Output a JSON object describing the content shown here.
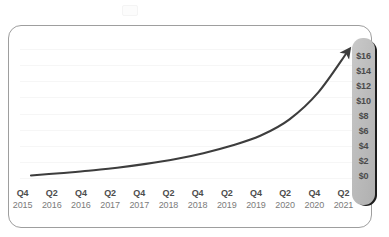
{
  "chart_data": {
    "type": "line",
    "title": "",
    "subtitle": "",
    "xlabel": "",
    "ylabel": "",
    "grid": true,
    "legend": "none",
    "arrow_head": true,
    "ylim": [
      0,
      16
    ],
    "y_ticks": [
      "$16",
      "$14",
      "$12",
      "$10",
      "$8",
      "$6",
      "$4",
      "$2",
      "$0"
    ],
    "y_tick_values": [
      16,
      14,
      12,
      10,
      8,
      6,
      4,
      2,
      0
    ],
    "categories": [
      "Q4 2015",
      "Q2 2016",
      "Q4 2016",
      "Q2 2017",
      "Q4 2017",
      "Q2 2018",
      "Q4 2018",
      "Q2 2019",
      "Q4 2019",
      "Q2 2020",
      "Q4 2020",
      "Q2 2021"
    ],
    "x_ticks": [
      {
        "quarter": "Q4",
        "year": "2015"
      },
      {
        "quarter": "Q2",
        "year": "2016"
      },
      {
        "quarter": "Q4",
        "year": "2016"
      },
      {
        "quarter": "Q2",
        "year": "2017"
      },
      {
        "quarter": "Q4",
        "year": "2017"
      },
      {
        "quarter": "Q2",
        "year": "2018"
      },
      {
        "quarter": "Q4",
        "year": "2018"
      },
      {
        "quarter": "Q2",
        "year": "2019"
      },
      {
        "quarter": "Q4",
        "year": "2019"
      },
      {
        "quarter": "Q2",
        "year": "2020"
      },
      {
        "quarter": "Q4",
        "year": "2020"
      },
      {
        "quarter": "Q2",
        "year": "2021"
      }
    ],
    "series": [
      {
        "name": "Growth",
        "values": [
          0.2,
          0.5,
          0.8,
          1.2,
          1.7,
          2.3,
          3.1,
          4.1,
          5.4,
          7.5,
          11.0,
          16.2
        ]
      }
    ]
  },
  "style": {
    "line_color": "#3d3d3d",
    "card_border_color": "#9e9e9e",
    "pill_color": "#bdbdbd",
    "pill_text_color": "#4a4a4a",
    "quarter_label_color": "#4d4d4d",
    "year_label_color": "#7b7b7b",
    "gridline_color": "#f6f6f6",
    "background": "#ffffff"
  }
}
